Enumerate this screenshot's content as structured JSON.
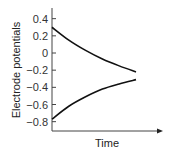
{
  "chart_data": {
    "type": "line",
    "title": "",
    "xlabel": "Time",
    "ylabel": "Electrode potentials",
    "ylim": [
      -0.9,
      0.5
    ],
    "xlim": [
      0,
      1.3
    ],
    "yticks": [
      0.4,
      0.2,
      0,
      -0.2,
      -0.4,
      -0.6,
      -0.8
    ],
    "ytick_labels": [
      "0.4",
      "0.2",
      "0",
      "−0.2",
      "−0.4",
      "−0.6",
      "−0.8"
    ],
    "xticks": [],
    "grid": false,
    "legend": "none",
    "series": [
      {
        "name": "upper electrode",
        "x": [
          0,
          0.2,
          0.4,
          0.6,
          0.8,
          1.0
        ],
        "y": [
          0.3,
          0.15,
          0.03,
          -0.07,
          -0.15,
          -0.22
        ]
      },
      {
        "name": "lower electrode",
        "x": [
          0,
          0.2,
          0.4,
          0.6,
          0.8,
          1.0
        ],
        "y": [
          -0.77,
          -0.62,
          -0.51,
          -0.42,
          -0.36,
          -0.31
        ]
      }
    ]
  }
}
